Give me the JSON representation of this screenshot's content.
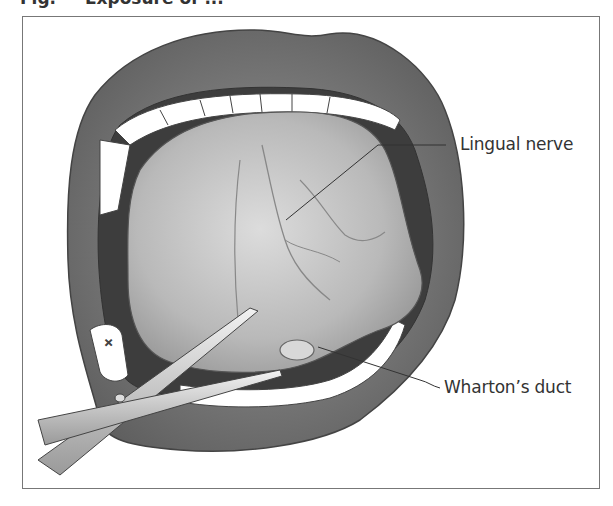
{
  "figure": {
    "caption_partial": "Fig. — Exposure of ...",
    "labels": {
      "lingual_nerve": "Lingual nerve",
      "whartons_duct": "Wharton’s duct"
    },
    "colors": {
      "lip": "#7a7a7a",
      "lip_dark": "#5e5e5e",
      "tongue": "#bdbdbd",
      "tongue_light": "#d6d6d6",
      "teeth": "#ffffff",
      "cavity": "#3d3d3d",
      "frame": "#777777",
      "label": "#333333"
    }
  }
}
